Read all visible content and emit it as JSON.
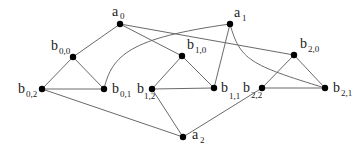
{
  "diagram": {
    "type": "graph",
    "nodes": [
      {
        "id": "a0",
        "base": "a",
        "sub": "0",
        "x": 120,
        "y": 24,
        "lx": 112,
        "ly": 16,
        "sx": 120,
        "sy": 19
      },
      {
        "id": "a1",
        "base": "a",
        "sub": "1",
        "x": 230,
        "y": 24,
        "lx": 234,
        "ly": 17,
        "sx": 242,
        "sy": 21
      },
      {
        "id": "a2",
        "base": "a",
        "sub": "2",
        "x": 183,
        "y": 137,
        "lx": 192,
        "ly": 139,
        "sx": 200,
        "sy": 143
      },
      {
        "id": "b00",
        "base": "b",
        "sub": "0,0",
        "x": 73,
        "y": 57,
        "lx": 51,
        "ly": 50,
        "sx": 59,
        "sy": 54
      },
      {
        "id": "b01",
        "base": "b",
        "sub": "0,1",
        "x": 104,
        "y": 89,
        "lx": 112,
        "ly": 93,
        "sx": 120,
        "sy": 97
      },
      {
        "id": "b02",
        "base": "b",
        "sub": "0,2",
        "x": 42,
        "y": 89,
        "lx": 18,
        "ly": 93,
        "sx": 26,
        "sy": 97
      },
      {
        "id": "b10",
        "base": "b",
        "sub": "1,0",
        "x": 182,
        "y": 56,
        "lx": 187,
        "ly": 49,
        "sx": 195,
        "sy": 53
      },
      {
        "id": "b11",
        "base": "b",
        "sub": "1,1",
        "x": 214,
        "y": 88,
        "lx": 221,
        "ly": 92,
        "sx": 229,
        "sy": 99
      },
      {
        "id": "b12",
        "base": "b",
        "sub": "1,2",
        "x": 152,
        "y": 89,
        "lx": 137,
        "ly": 93,
        "sx": 144,
        "sy": 99
      },
      {
        "id": "b20",
        "base": "b",
        "sub": "2,0",
        "x": 294,
        "y": 55,
        "lx": 300,
        "ly": 48,
        "sx": 308,
        "sy": 52
      },
      {
        "id": "b21",
        "base": "b",
        "sub": "2,1",
        "x": 325,
        "y": 88,
        "lx": 333,
        "ly": 92,
        "sx": 341,
        "sy": 96
      },
      {
        "id": "b22",
        "base": "b",
        "sub": "2,2",
        "x": 262,
        "y": 88,
        "lx": 243,
        "ly": 92,
        "sx": 251,
        "sy": 98
      }
    ],
    "edges": [
      {
        "from": "a0",
        "to": "b00",
        "kind": "straight"
      },
      {
        "from": "a0",
        "to": "b10",
        "kind": "straight"
      },
      {
        "from": "a0",
        "to": "b20",
        "kind": "straight"
      },
      {
        "from": "b01",
        "to": "a1",
        "kind": "curve",
        "path": "M104 89 C 112 55, 130 38, 230 24"
      },
      {
        "from": "a1",
        "to": "b11",
        "kind": "straight"
      },
      {
        "from": "a1",
        "to": "b21",
        "kind": "curve",
        "path": "M230 24 C 240 60, 250 65, 325 88"
      },
      {
        "from": "b00",
        "to": "b02",
        "kind": "straight"
      },
      {
        "from": "b00",
        "to": "b01",
        "kind": "straight"
      },
      {
        "from": "b02",
        "to": "b01",
        "kind": "straight"
      },
      {
        "from": "b10",
        "to": "b12",
        "kind": "straight"
      },
      {
        "from": "b10",
        "to": "b11",
        "kind": "straight"
      },
      {
        "from": "b12",
        "to": "b11",
        "kind": "straight"
      },
      {
        "from": "b20",
        "to": "b22",
        "kind": "straight"
      },
      {
        "from": "b20",
        "to": "b21",
        "kind": "straight"
      },
      {
        "from": "b22",
        "to": "b21",
        "kind": "straight"
      },
      {
        "from": "b02",
        "to": "a2",
        "kind": "straight"
      },
      {
        "from": "b12",
        "to": "a2",
        "kind": "straight"
      },
      {
        "from": "b22",
        "to": "a2",
        "kind": "straight"
      }
    ],
    "colors": {
      "edge": "#6a6a6a",
      "node": "#000000",
      "label": "#222222",
      "background": "#ffffff"
    }
  }
}
